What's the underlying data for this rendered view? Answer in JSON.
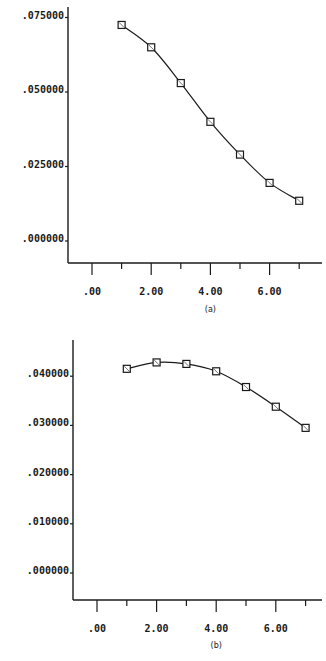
{
  "chart_data": [
    {
      "type": "line",
      "panel_label": "(a)",
      "title": "",
      "xlabel": "",
      "ylabel": "",
      "x": [
        1,
        2,
        3,
        4,
        5,
        6,
        7
      ],
      "series": [
        {
          "name": "series",
          "marker": "square",
          "values": [
            0.0725,
            0.065,
            0.053,
            0.04,
            0.029,
            0.0195,
            0.0135
          ]
        }
      ],
      "x_ticks": [
        0,
        2,
        4,
        6
      ],
      "x_tick_labels": [
        ".00",
        "2.00",
        "4.00",
        "6.00"
      ],
      "x_minor_ticks": [
        1,
        3,
        5,
        7
      ],
      "y_ticks": [
        0,
        0.025,
        0.05,
        0.075
      ],
      "y_tick_labels": [
        ".000000",
        ".025000",
        ".050000",
        ".075000"
      ],
      "xlim": [
        -0.8,
        7.6
      ],
      "ylim": [
        -0.0073,
        0.0785
      ],
      "grid": false,
      "legend": null
    },
    {
      "type": "line",
      "panel_label": "(b)",
      "title": "",
      "xlabel": "",
      "ylabel": "",
      "x": [
        1,
        2,
        3,
        4,
        5,
        6,
        7
      ],
      "series": [
        {
          "name": "series",
          "marker": "square",
          "values": [
            0.0415,
            0.0428,
            0.0425,
            0.041,
            0.0378,
            0.0338,
            0.0295
          ]
        }
      ],
      "x_ticks": [
        0,
        2,
        4,
        6
      ],
      "x_tick_labels": [
        ".00",
        "2.00",
        "4.00",
        "6.00"
      ],
      "x_minor_ticks": [
        1,
        3,
        5,
        7
      ],
      "y_ticks": [
        0,
        0.01,
        0.02,
        0.03,
        0.04
      ],
      "y_tick_labels": [
        ".000000",
        ".010000",
        ".020000",
        ".030000",
        ".040000"
      ],
      "xlim": [
        -0.7,
        7.6
      ],
      "ylim": [
        -0.0055,
        0.0465
      ],
      "grid": false,
      "legend": null
    }
  ],
  "colors": {
    "ink": "#1a1a1a",
    "background": "#ffffff"
  }
}
